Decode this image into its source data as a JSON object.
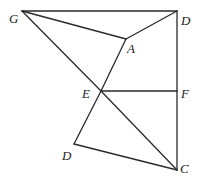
{
  "diagram": {
    "type": "geometry-figure",
    "points": {
      "G": {
        "label": "G",
        "x": 22,
        "y": 11
      },
      "D1": {
        "label": "D",
        "x": 177,
        "y": 11
      },
      "A": {
        "label": "A",
        "x": 126,
        "y": 39
      },
      "E": {
        "label": "E",
        "x": 101,
        "y": 91
      },
      "F": {
        "label": "F",
        "x": 177,
        "y": 91
      },
      "D2": {
        "label": "D",
        "x": 74,
        "y": 144
      },
      "C": {
        "label": "C",
        "x": 177,
        "y": 170
      }
    },
    "segments": [
      [
        "G",
        "D1"
      ],
      [
        "G",
        "A"
      ],
      [
        "A",
        "D1"
      ],
      [
        "D1",
        "F"
      ],
      [
        "F",
        "C"
      ],
      [
        "G",
        "E"
      ],
      [
        "E",
        "C"
      ],
      [
        "A",
        "E"
      ],
      [
        "E",
        "F"
      ],
      [
        "E",
        "D2"
      ],
      [
        "D2",
        "C"
      ]
    ],
    "labels": {
      "G": "G",
      "D_top": "D",
      "A": "A",
      "E": "E",
      "F": "F",
      "D_bottom": "D",
      "C": "C"
    }
  }
}
